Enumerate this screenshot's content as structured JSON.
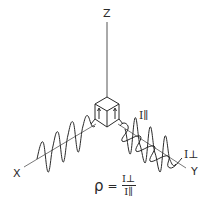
{
  "diagram": {
    "axes": {
      "z_label": "Z",
      "x_label": "X",
      "y_label": "Y"
    },
    "intensity_labels": {
      "parallel": "I∥",
      "perpendicular": "I⊥"
    },
    "formula": {
      "lhs": "ρ",
      "equals": "=",
      "numerator": "I⊥",
      "denominator": "I∥"
    },
    "colors": {
      "line": "#2a2a2a",
      "background": "#ffffff"
    }
  }
}
